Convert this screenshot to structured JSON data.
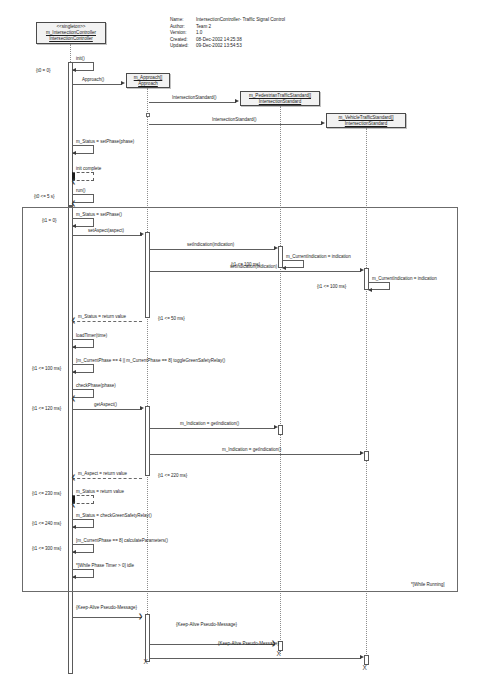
{
  "diagram": {
    "kind": "uml-sequence-diagram"
  },
  "meta": {
    "name_key": "Name:",
    "name_value": "IntersectionController- Traffic Signal Control",
    "author_key": "Author:",
    "author_value": "Team 2",
    "version_key": "Version:",
    "version_value": "1.0",
    "created_key": "Created:",
    "created_value": "08-Dec-2002 14:25:38",
    "updated_key": "Updated:",
    "updated_value": "09-Dec-2002 13:54:53"
  },
  "objects": [
    {
      "id": "controller",
      "stereotype": "<<singleton>>",
      "instance": "m_IntersectionController",
      "classifier": "IntersectionController"
    },
    {
      "id": "approach",
      "stereotype": "",
      "instance": "m_Approach[]",
      "classifier": "Approach"
    },
    {
      "id": "pedestrian",
      "stereotype": "",
      "instance": "m_PedestrianTrafficStandard[]",
      "classifier": "IntersectionStandard"
    },
    {
      "id": "vehicle",
      "stereotype": "",
      "instance": "m_VehicleTrafficStandard[]",
      "classifier": "IntersectionStandard"
    }
  ],
  "messages": {
    "init": "init()",
    "approach_create": "Approach()",
    "ped_create": "IntersectionStandard()",
    "veh_create": "IntersectionStandard()",
    "set_phase_init": "m_Status = setPhase(phase)",
    "init_complete": "init complete",
    "run": "run()",
    "set_phase_loop": "m_Status = setPhase()",
    "set_aspect": "setAspect(aspect)",
    "set_indication_ped": "setIndication(indication)",
    "current_indication_ped": "m_CurrentIndication = indication",
    "set_indication_veh": "setIndication(indication)",
    "current_indication_veh": "m_CurrentIndication = indication",
    "status_return_1": "m_Status = return value",
    "load_timer": "loadTimer(time)",
    "toggle_relay": "[m_CurrentPhase == 4 || m_CurrentPhase == 8] toggleGreenSafetyRelay()",
    "check_phase": "checkPhase(phase)",
    "get_aspect": "getAspect()",
    "get_indication_ped": "m_Indication = getIndication()",
    "get_indication_veh": "m_Indication = getIndication()",
    "aspect_return": "m_Aspect = return value",
    "status_return_2": "m_Status = return value",
    "check_relay": "m_Status = checkGreenSafetyRelay()",
    "calculate_params": "[m_CurrentPhase == 8] calculateParameters()",
    "idle": "*[While Phase Timer > 0] idle",
    "keep_alive_1": "{Keep-Alive Pseudo-Message}",
    "keep_alive_2": "{Keep-Alive Pseudo-Message}",
    "keep_alive_3": "{Keep-Alive Pseudo-Message}"
  },
  "constraints": {
    "t0_zero": "{t0 = 0}",
    "t0_5s": "{t0 <= 5 s}",
    "t1_zero": "{t1 = 0}",
    "t1_100_a": "{t1 <= 100 ms}",
    "t1_100_b": "{t1 <= 100 ms}",
    "t1_50": "{t1 <= 50 ms}",
    "t1_100_c": "{t1 <= 100 ms}",
    "t1_120": "{t1 <= 120 ms}",
    "t1_220": "{t1 <= 220 ms}",
    "t1_230": "{t1 <= 230 ms}",
    "t1_240": "{t1 <= 240 ms}",
    "t1_300": "{t1 <= 300 ms}"
  },
  "loop_frame": {
    "label": "*[While Running]"
  },
  "termination": {
    "mark": "X"
  },
  "colors": {
    "line": "#5e5e5e",
    "box_fill": "#f2f2f2",
    "box_border": "#4a4a4a",
    "lifeline": "#8d8d8d",
    "text": "#1c1c1c",
    "background": "#ffffff"
  }
}
